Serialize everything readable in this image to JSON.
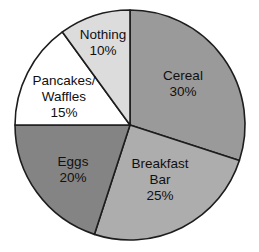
{
  "figure": {
    "background_color": "#ffffff",
    "outline_color": "#1d1d1d"
  },
  "chart_data": {
    "type": "pie",
    "title": "",
    "subtitle": "",
    "xlabel": "",
    "ylabel": "",
    "legend_position": "none",
    "labels_inside_slices": true,
    "start_angle_deg": 0,
    "direction": "clockwise",
    "total": 100,
    "unit": "%",
    "categories": [
      "Cereal",
      "Breakfast Bar",
      "Eggs",
      "Pancakes/Waffles",
      "Nothing"
    ],
    "values": [
      30,
      25,
      20,
      15,
      10
    ],
    "colors": [
      "#9a9a9a",
      "#adadad",
      "#848484",
      "#ffffff",
      "#dcdcdc"
    ],
    "slices": [
      {
        "name": "Cereal",
        "value": 30,
        "value_text": "30%",
        "color": "#9a9a9a",
        "start_angle_deg": 0,
        "end_angle_deg": 108,
        "label_lines": [
          "Cereal",
          "30%"
        ],
        "label_x": 183,
        "label_y": 84
      },
      {
        "name": "Breakfast Bar",
        "value": 25,
        "value_text": "25%",
        "color": "#adadad",
        "start_angle_deg": 108,
        "end_angle_deg": 198,
        "label_lines": [
          "Breakfast",
          "Bar",
          "25%"
        ],
        "label_x": 160,
        "label_y": 180
      },
      {
        "name": "Eggs",
        "value": 20,
        "value_text": "20%",
        "color": "#848484",
        "start_angle_deg": 198,
        "end_angle_deg": 270,
        "label_lines": [
          "Eggs",
          "20%"
        ],
        "label_x": 73,
        "label_y": 170
      },
      {
        "name": "Pancakes/Waffles",
        "value": 15,
        "value_text": "15%",
        "color": "#ffffff",
        "start_angle_deg": 270,
        "end_angle_deg": 324,
        "label_lines": [
          "Pancakes/",
          "Waffles",
          "15%"
        ],
        "label_x": 64,
        "label_y": 97
      },
      {
        "name": "Nothing",
        "value": 10,
        "value_text": "10%",
        "color": "#dcdcdc",
        "start_angle_deg": 324,
        "end_angle_deg": 360,
        "label_lines": [
          "Nothing",
          "10%"
        ],
        "label_x": 103,
        "label_y": 43
      }
    ],
    "geometry": {
      "center_x": 130,
      "center_y": 125,
      "radius": 115
    }
  }
}
